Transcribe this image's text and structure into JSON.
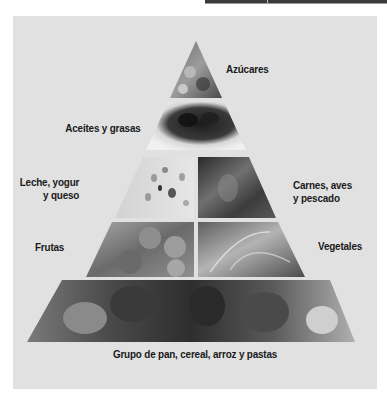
{
  "diagram": {
    "type": "food-pyramid",
    "tiers": [
      {
        "id": "tier-1",
        "sections": [
          {
            "label": "Azúcares",
            "image": "sweets-photo"
          }
        ]
      },
      {
        "id": "tier-2",
        "sections": [
          {
            "label": "Aceites y grasas",
            "image": "olives-oil-photo"
          }
        ]
      },
      {
        "id": "tier-3",
        "sections": [
          {
            "label_line1": "Leche, yogur",
            "label_line2": "y queso",
            "image": "cheese-photo"
          },
          {
            "label_line1": "Carnes, aves",
            "label_line2": "y pescado",
            "image": "meat-photo"
          }
        ]
      },
      {
        "id": "tier-4",
        "sections": [
          {
            "label": "Frutas",
            "image": "fruits-photo"
          },
          {
            "label": "Vegetales",
            "image": "vegetables-photo"
          }
        ]
      },
      {
        "id": "tier-5",
        "sections": [
          {
            "label": "Grupo de pan, cereal, arroz y pastas",
            "image": "bread-grains-photo"
          }
        ]
      }
    ]
  },
  "colors": {
    "panel_background": "#e1e1e1",
    "label_text": "#1a1a1a",
    "separator": "#f2f2f2"
  }
}
